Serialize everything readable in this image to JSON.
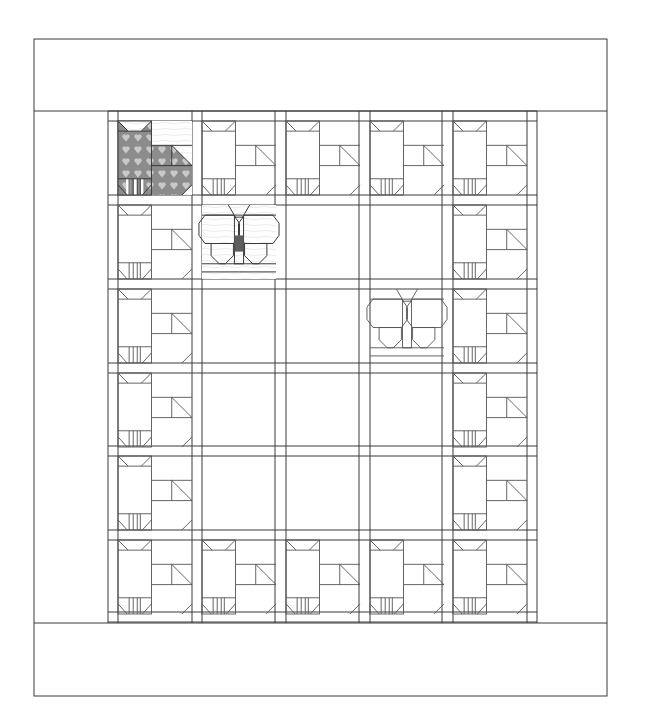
{
  "colors": {
    "background": "#ffffff",
    "line": "#3a3a3a",
    "fabric_cat": "#8c8c8c",
    "fabric_cat_hearts": "#c9c9c9",
    "fabric_butterfly_light": "#bdbdbd",
    "fabric_butterfly_dark": "#5e5e5e",
    "fabric_butterfly_body": "#111111"
  },
  "quilt": {
    "outer": {
      "x": 34,
      "y": 39,
      "w": 573,
      "h": 657
    },
    "top_border_bottom_y": 111,
    "bottom_border_top_y": 623,
    "sashing_x": [
      108,
      118,
      192,
      202,
      275,
      286,
      359,
      370,
      442,
      453,
      527,
      537
    ],
    "sashing_y": [
      111,
      121,
      195,
      205,
      279,
      289,
      363,
      373,
      446,
      456,
      530,
      540,
      612,
      622
    ],
    "block_size": 74,
    "col_x": [
      118,
      202,
      286,
      370,
      453
    ],
    "row_y": [
      121,
      205,
      289,
      373,
      456,
      540
    ],
    "blocks": [
      [
        "cat-fabric",
        "cat",
        "cat",
        "cat",
        "cat"
      ],
      [
        "cat",
        "butterfly-fabric",
        "empty",
        "empty",
        "cat"
      ],
      [
        "cat",
        "empty",
        "empty",
        "butterfly-outline",
        "cat"
      ],
      [
        "cat",
        "empty",
        "empty",
        "empty",
        "cat"
      ],
      [
        "cat",
        "empty",
        "empty",
        "empty",
        "cat"
      ],
      [
        "cat",
        "cat",
        "cat",
        "cat",
        "cat"
      ]
    ],
    "legend": {
      "cat": "Cat block",
      "butterfly": "Butterfly block",
      "empty": "Plain square"
    }
  }
}
